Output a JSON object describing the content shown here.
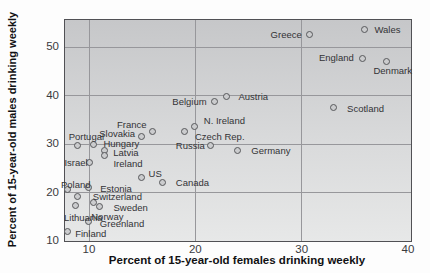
{
  "chart_data": {
    "type": "scatter",
    "xlabel": "Percent of 15-year-old females drinking weekly",
    "ylabel": "Percent of 15-year-old males drinking weekly",
    "xlim": [
      7.74,
      40.28
    ],
    "ylim": [
      10,
      55.6
    ],
    "x_ticks": [
      10,
      20,
      30,
      40
    ],
    "y_ticks": [
      10,
      20,
      30,
      40,
      50
    ],
    "gridlines": {
      "x": [
        10,
        20,
        30
      ],
      "y": [
        20,
        30,
        40,
        50
      ]
    },
    "grid": true,
    "legend": "none",
    "points": [
      {
        "country": "Wales",
        "x": 36.0,
        "y": 53.5,
        "label_dx": 22,
        "label_dy": 0
      },
      {
        "country": "Greece",
        "x": 30.8,
        "y": 52.6,
        "label_dx": -24,
        "label_dy": 0
      },
      {
        "country": "England",
        "x": 35.8,
        "y": 47.6,
        "label_dx": -27,
        "label_dy": -1
      },
      {
        "country": "Denmark",
        "x": 38.0,
        "y": 47.0,
        "label_dx": 6,
        "label_dy": 9
      },
      {
        "country": "Austria",
        "x": 23.0,
        "y": 39.7,
        "label_dx": 26,
        "label_dy": 0
      },
      {
        "country": "Belgium",
        "x": 21.8,
        "y": 38.7,
        "label_dx": -25,
        "label_dy": 0
      },
      {
        "country": "Scotland",
        "x": 33.0,
        "y": 37.5,
        "label_dx": 32,
        "label_dy": 1
      },
      {
        "country": "N. Ireland",
        "x": 20.0,
        "y": 33.5,
        "label_dx": 29,
        "label_dy": -6
      },
      {
        "country": "Czech Rep.",
        "x": 19.0,
        "y": 32.5,
        "label_dx": 35,
        "label_dy": 5
      },
      {
        "country": "France",
        "x": 16.0,
        "y": 32.5,
        "label_dx": -21,
        "label_dy": -7
      },
      {
        "country": "Slovakia",
        "x": 15.0,
        "y": 31.5,
        "label_dx": -25,
        "label_dy": -3
      },
      {
        "country": "Hungary",
        "x": 10.5,
        "y": 29.9,
        "label_dx": 27,
        "label_dy": -1
      },
      {
        "country": "Russia",
        "x": 21.5,
        "y": 29.5,
        "label_dx": -21,
        "label_dy": 0
      },
      {
        "country": "Portugal",
        "x": 9.0,
        "y": 29.5,
        "label_dx": 8,
        "label_dy": -9
      },
      {
        "country": "Germany",
        "x": 24.0,
        "y": 28.5,
        "label_dx": 33,
        "label_dy": 0
      },
      {
        "country": "Latvia",
        "x": 11.5,
        "y": 28.6,
        "label_dx": 21,
        "label_dy": 2
      },
      {
        "country": "Ireland",
        "x": 11.5,
        "y": 27.6,
        "label_dx": 23,
        "label_dy": 8
      },
      {
        "country": "Israel",
        "x": 10.1,
        "y": 26.0,
        "label_dx": -14,
        "label_dy": 0
      },
      {
        "country": "US",
        "x": 15.0,
        "y": 23.0,
        "label_dx": 13,
        "label_dy": -4
      },
      {
        "country": "Canada",
        "x": 17.0,
        "y": 22.0,
        "label_dx": 29,
        "label_dy": 0
      },
      {
        "country": "Estonia",
        "x": 10.0,
        "y": 21.0,
        "label_dx": 27,
        "label_dy": 1
      },
      {
        "country": "Poland",
        "x": 8.0,
        "y": 20.5,
        "label_dx": 8,
        "label_dy": -5
      },
      {
        "country": "Switzerland",
        "x": 9.0,
        "y": 19.0,
        "label_dx": 39,
        "label_dy": 0
      },
      {
        "country": "Norway",
        "x": 10.5,
        "y": 17.8,
        "label_dx": 13,
        "label_dy": 14
      },
      {
        "country": "Lithuania",
        "x": 8.8,
        "y": 17.3,
        "label_dx": 7,
        "label_dy": 12
      },
      {
        "country": "Sweden",
        "x": 11.0,
        "y": 17.1,
        "label_dx": 31,
        "label_dy": 1
      },
      {
        "country": "Greenland",
        "x": 10.0,
        "y": 13.9,
        "label_dx": 33,
        "label_dy": 2
      },
      {
        "country": "Finland",
        "x": 8.0,
        "y": 11.8,
        "label_dx": 23,
        "label_dy": 2
      }
    ],
    "colors": {
      "page_bg": "#fdfdfd",
      "plot_bg_top": "#c6c7c9",
      "plot_bg_bottom": "#e7e8e8",
      "gridline": "#97979b",
      "frame": "#515155",
      "dot_fill": "#cbccce",
      "dot_border": "#57585b",
      "point_label_text": "#333336",
      "tick_text": "#3a3a3d",
      "axis_title_text": "#111113"
    }
  }
}
